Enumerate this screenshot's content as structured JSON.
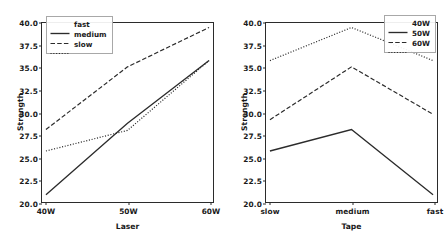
{
  "figure": {
    "background": "#ffffff",
    "line_color": "#2b2b2b",
    "panel_count": 2
  },
  "chart_data": [
    {
      "type": "line",
      "panel": "left",
      "title": "",
      "xlabel": "Laser",
      "ylabel": "Strength",
      "categories": [
        "40W",
        "50W",
        "60W"
      ],
      "ylim": [
        20.0,
        40.0
      ],
      "yticks": [
        "20.0",
        "22.5",
        "25.0",
        "27.5",
        "30.0",
        "32.5",
        "35.0",
        "37.5",
        "40.0"
      ],
      "ytick_values": [
        20.0,
        22.5,
        25.0,
        27.5,
        30.0,
        32.5,
        35.0,
        37.5,
        40.0
      ],
      "grid": false,
      "legend_position": "upper left",
      "series": [
        {
          "name": "fast",
          "values": [
            20.8,
            28.8,
            35.8
          ],
          "style": "solid"
        },
        {
          "name": "medium",
          "values": [
            28.1,
            35.1,
            39.5
          ],
          "style": "dashed"
        },
        {
          "name": "slow",
          "values": [
            25.7,
            28.0,
            35.8
          ],
          "style": "dotted"
        }
      ]
    },
    {
      "type": "line",
      "panel": "right",
      "title": "",
      "xlabel": "Tape",
      "ylabel": "Strength",
      "categories": [
        "slow",
        "medium",
        "fast"
      ],
      "ylim": [
        20.0,
        40.0
      ],
      "yticks": [
        "20.0",
        "22.5",
        "25.0",
        "27.5",
        "30.0",
        "32.5",
        "35.0",
        "37.5",
        "40.0"
      ],
      "ytick_values": [
        20.0,
        22.5,
        25.0,
        27.5,
        30.0,
        32.5,
        35.0,
        37.5,
        40.0
      ],
      "grid": false,
      "legend_position": "upper right",
      "series": [
        {
          "name": "40W",
          "values": [
            25.7,
            28.1,
            20.8
          ],
          "style": "solid"
        },
        {
          "name": "50W",
          "values": [
            29.2,
            35.1,
            29.8
          ],
          "style": "dashed"
        },
        {
          "name": "60W",
          "values": [
            35.8,
            39.5,
            35.8
          ],
          "style": "dotted"
        }
      ]
    }
  ]
}
